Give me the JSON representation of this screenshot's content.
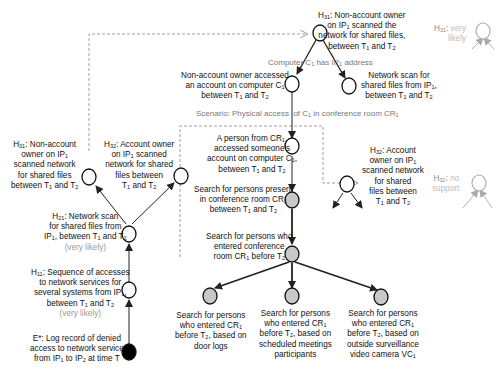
{
  "diagram": {
    "nodes": {
      "h31_top": {
        "title": "H31: Non-account owner on IP1 scanned the network for shared files, between T1 and T2",
        "fill": "#ffffff"
      },
      "h31_faded": {
        "label": "H31:",
        "status": "very likely",
        "fill": "#ffffff"
      },
      "non_account_access": {
        "title": "Non-account owner accessed an account on computer C1 between T1 and T2",
        "fill": "#ffffff"
      },
      "network_scan_ip1": {
        "title": "Network scan for shared files from IP1, between T1 and T2",
        "fill": "#ffffff"
      },
      "person_cr1": {
        "title": "A person from CR1, accessed someone's account on computer C1, between T1 and T2",
        "fill": "#ffffff"
      },
      "search_present": {
        "title": "Search for persons present in conference room CR1 between T1 and T2",
        "fill": "#c8c8c8"
      },
      "search_entered": {
        "title": "Search for persons who entered conference room CR1 before T2",
        "fill": "#c8c8c8"
      },
      "search_door": {
        "title": "Search for persons who entered CR1 before T2, based on door logs",
        "fill": "#c8c8c8"
      },
      "search_meetings": {
        "title": "Search for persons who entered CR1 before T2, based on scheduled meetings participants",
        "fill": "#c8c8c8"
      },
      "search_camera": {
        "title": "Search for persons who entered CR1 before T2, based on outside surveillance video camera VC1",
        "fill": "#c8c8c8"
      },
      "h31_left": {
        "title": "H31: Non-account owner on IP1 scanned network for shared files between T1 and T2",
        "fill": "#ffffff"
      },
      "h32_left": {
        "title": "H32: Account owner on IP1 scanned network for shared files between T1 and T2",
        "fill": "#ffffff"
      },
      "h32_right": {
        "title": "H32: Account owner on IP1 scanned network for shared files between T1 and T2",
        "fill": "#ffffff"
      },
      "h32_faded": {
        "label": "H32:",
        "status": "no support",
        "fill": "#ffffff"
      },
      "h21": {
        "title": "H21: Network scan for shared files from IP1, between T1 and T2",
        "status": "very likely",
        "fill": "#ffffff"
      },
      "h11": {
        "title": "H11: Sequence of accesses to network services for several systems from IP1, between T1 and T2",
        "status": "very likely",
        "fill": "#ffffff"
      },
      "e_star": {
        "title": "E*: Log record of denied access to network service from IP1 to IP2 at time T",
        "fill": "#000000"
      }
    },
    "edge_labels": {
      "computer_has_ip": "Computer C1 has IP1 address",
      "scenario": "Scenario: Physical access of C1 in conference room CR1"
    },
    "colors": {
      "evidence": "#000000",
      "search": "#c8c8c8",
      "hypothesis": "#ffffff",
      "faded": "#bdbdbd",
      "status_text": "#9a9a9a"
    }
  }
}
